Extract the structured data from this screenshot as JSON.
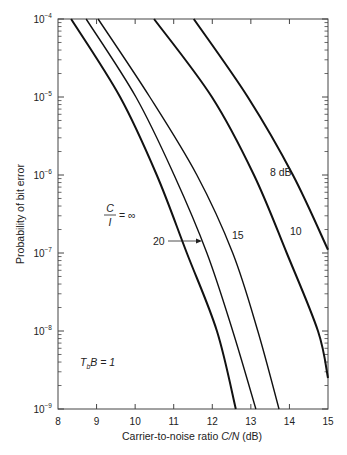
{
  "chart_data": {
    "type": "line",
    "title": "",
    "xlabel": "Carrier-to-noise ratio C/N (dB)",
    "ylabel": "Probability of bit error",
    "xlim": [
      8,
      15
    ],
    "ylim": [
      1e-09,
      0.0001
    ],
    "yscale": "log",
    "grid": false,
    "x_ticks": [
      8,
      9,
      10,
      11,
      12,
      13,
      14,
      15
    ],
    "y_ticks": [
      "10^-4",
      "10^-5",
      "10^-6",
      "10^-7",
      "10^-8",
      "10^-9"
    ],
    "annotation": "T_b B = 1",
    "legend_position": "inline labels on curves",
    "series": [
      {
        "name": "C/I = ∞",
        "points": [
          [
            8.34,
            0.0001
          ],
          [
            9.61,
            1e-05
          ],
          [
            10.56,
            1e-06
          ],
          [
            11.34,
            1e-07
          ],
          [
            12.12,
            1e-08
          ],
          [
            12.61,
            1e-09
          ]
        ]
      },
      {
        "name": "20",
        "points": [
          [
            8.73,
            0.0001
          ],
          [
            10.02,
            1e-05
          ],
          [
            11.01,
            1e-06
          ],
          [
            11.86,
            1e-07
          ],
          [
            12.53,
            1e-08
          ],
          [
            13.13,
            1e-09
          ]
        ]
      },
      {
        "name": "15",
        "points": [
          [
            9.04,
            0.0001
          ],
          [
            10.38,
            1e-05
          ],
          [
            11.6,
            1e-06
          ],
          [
            12.53,
            1e-07
          ],
          [
            13.18,
            1e-08
          ],
          [
            13.73,
            1e-09
          ]
        ]
      },
      {
        "name": "10",
        "points": [
          [
            10.49,
            0.0001
          ],
          [
            11.99,
            1e-05
          ],
          [
            13.08,
            1e-06
          ],
          [
            13.93,
            1e-07
          ],
          [
            14.74,
            1e-08
          ],
          [
            15.0,
            2.5e-09
          ]
        ]
      },
      {
        "name": "8 dB",
        "points": [
          [
            11.52,
            0.0001
          ],
          [
            12.92,
            1e-05
          ],
          [
            14.09,
            1e-06
          ],
          [
            15.0,
            1.1e-07
          ]
        ]
      }
    ]
  },
  "labels": {
    "xlabel_prefix": "Carrier-to-noise ratio ",
    "xlabel_var": "C/N",
    "xlabel_suffix": " (dB)",
    "ylabel": "Probability of bit error",
    "ci_numer": "C",
    "ci_denom": "I",
    "ci_eq": "= ∞",
    "label_20": "20",
    "label_15": "15",
    "label_10": "10",
    "label_8": "8 dB",
    "tb_T": "T",
    "tb_sub": "b",
    "tb_rest": "B = 1"
  },
  "style": {
    "line_color": "#111111",
    "axis_color": "#444444"
  }
}
